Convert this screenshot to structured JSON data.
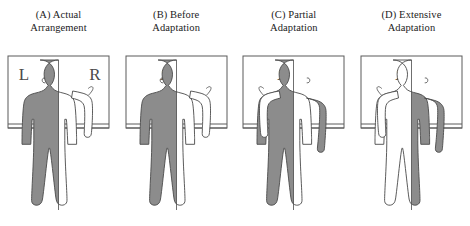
{
  "figure": {
    "background": "#ffffff",
    "ink": "#1b1b1b",
    "body_gray": "#8c8c8c",
    "body_white": "#ffffff",
    "outline": "#4a4a4a",
    "frame_color": "#5a5a5a"
  },
  "panels": [
    {
      "id": "a",
      "title": "(A) Actual\nArrangement",
      "label": "(A)",
      "caption": "Actual Arrangement",
      "left_letter": "L",
      "right_letter": "R",
      "letters_mirrored": false,
      "raised_arm": "right",
      "shaded_half": "left",
      "shading_note": "body left half gray, right half white"
    },
    {
      "id": "b",
      "title": "(B) Before\nAdaptation",
      "label": "(B)",
      "caption": "Before Adaptation",
      "left_letter": "R",
      "right_letter": "L",
      "letters_mirrored": true,
      "raised_arm": "right",
      "shaded_half": "left",
      "shading_note": "body left half gray, right half white"
    },
    {
      "id": "c",
      "title": "(C) Partial\nAdaptation",
      "label": "(C)",
      "caption": "Partial Adaptation",
      "left_letter": "R",
      "right_letter": "L",
      "letters_mirrored": true,
      "raised_arm": "left",
      "shaded_half": "center-left",
      "shading_note": "torso left-of-centre gray, right arm gray, raised left arm white"
    },
    {
      "id": "d",
      "title": "(D) Extensive\nAdaptation",
      "label": "(D)",
      "caption": "Extensive Adaptation",
      "left_letter": "R",
      "right_letter": "L",
      "letters_mirrored": true,
      "raised_arm": "left",
      "shaded_half": "right",
      "shading_note": "body right half gray, left half white"
    }
  ]
}
